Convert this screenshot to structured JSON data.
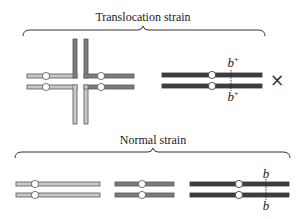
{
  "figure": {
    "colors": {
      "light": "#c9c9c9",
      "medium": "#7c7c7c",
      "dark": "#3e3e3e",
      "outline": "#555555",
      "centromere": "#ffffff"
    },
    "translocation_strain": {
      "label": "Translocation strain",
      "reciprocal_translocation_cross": {
        "description": "light and medium-gray chromosomes exchanged arms, forming a cross-shaped pairing"
      },
      "dark_pair": {
        "locus_top": "b",
        "locus_top_sup": "+",
        "locus_bottom": "b",
        "locus_bottom_sup": "+"
      },
      "cross_symbol": "×"
    },
    "normal_strain": {
      "label": "Normal strain",
      "pairs": [
        {
          "shade": "light"
        },
        {
          "shade": "medium"
        },
        {
          "shade": "dark",
          "locus_top": "b",
          "locus_bottom": "b"
        }
      ]
    }
  }
}
